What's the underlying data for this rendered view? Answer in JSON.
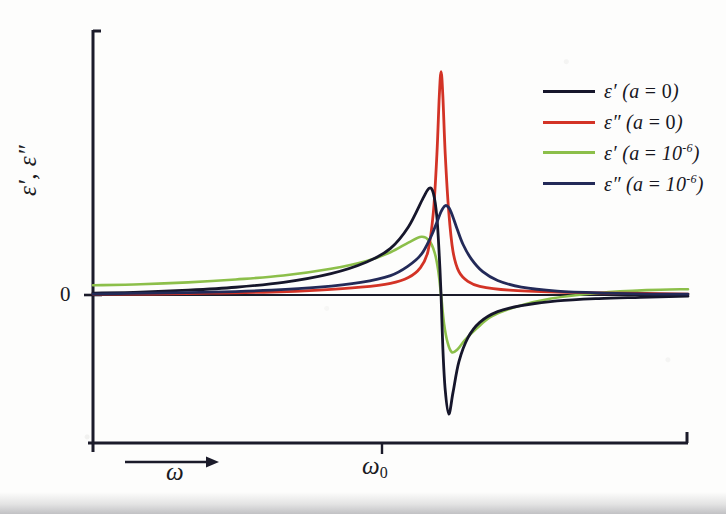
{
  "figure": {
    "background_color": "#fdfdfc",
    "axis_color": "#1b1b2a"
  },
  "labels": {
    "ylabel": "ε′, ε″",
    "zero_tick": "0",
    "omega_label": "ω",
    "omega0_label": "ω",
    "omega0_subscript": "0"
  },
  "legend": {
    "entries": [
      {
        "label_prefix": "ε′",
        "label_suffix": " (a = 0)",
        "color": "#16162b",
        "exponent": ""
      },
      {
        "label_prefix": "ε″",
        "label_suffix": " (a = 0)",
        "color": "#d33326",
        "exponent": ""
      },
      {
        "label_prefix": "ε′",
        "label_suffix": " (a = 10",
        "color": "#8cbf4a",
        "exponent": "-6"
      },
      {
        "label_prefix": "ε″",
        "label_suffix": " (a = 10",
        "color": "#232a58",
        "exponent": "-6"
      }
    ]
  },
  "chart_data": {
    "type": "line",
    "title": "",
    "xlabel": "ω",
    "ylabel": "ε′, ε″",
    "xlim": [
      0,
      1
    ],
    "ylim": [
      -1.05,
      2.4
    ],
    "grid": false,
    "legend_position": "upper-right",
    "xticks": [
      {
        "value": 0.585,
        "label": "ω0"
      }
    ],
    "yticks": [
      {
        "value": 0,
        "label": "0"
      }
    ],
    "annotations": [
      {
        "text": "ω",
        "type": "arrow-label",
        "position": "below-axis-left"
      }
    ],
    "resonance_x": 0.585,
    "series": [
      {
        "name": "ε′ (a = 0)",
        "color": "#16162b",
        "description": "Lorentz real part, undamped-limit: rises to a sharp positive maximum just below resonance, crosses zero at ω0, deep negative minimum just above resonance, then recovers toward zero.",
        "x": [
          0.0,
          0.08,
          0.16,
          0.24,
          0.32,
          0.4,
          0.46,
          0.5,
          0.53,
          0.555,
          0.565,
          0.572,
          0.578,
          0.582,
          0.585,
          0.588,
          0.592,
          0.598,
          0.605,
          0.615,
          0.63,
          0.65,
          0.68,
          0.72,
          0.78,
          0.85,
          0.92,
          1.0
        ],
        "y": [
          0.02,
          0.03,
          0.05,
          0.08,
          0.13,
          0.22,
          0.34,
          0.48,
          0.7,
          1.0,
          1.1,
          1.05,
          0.8,
          0.4,
          0.0,
          -0.45,
          -0.8,
          -1.0,
          -0.82,
          -0.56,
          -0.36,
          -0.23,
          -0.14,
          -0.09,
          -0.05,
          -0.03,
          -0.02,
          -0.01
        ]
      },
      {
        "name": "ε″ (a = 0)",
        "color": "#d33326",
        "description": "Lorentz imaginary part, undamped-limit: tall narrow symmetric peak centered at ω0 reaching the top of the plot.",
        "x": [
          0.0,
          0.1,
          0.2,
          0.3,
          0.38,
          0.45,
          0.5,
          0.53,
          0.55,
          0.563,
          0.572,
          0.578,
          0.582,
          0.585,
          0.588,
          0.592,
          0.598,
          0.605,
          0.615,
          0.63,
          0.65,
          0.7,
          0.78,
          0.88,
          1.0
        ],
        "y": [
          0.01,
          0.01,
          0.02,
          0.03,
          0.05,
          0.08,
          0.12,
          0.18,
          0.28,
          0.45,
          0.85,
          1.45,
          2.05,
          2.3,
          2.05,
          1.45,
          0.85,
          0.45,
          0.24,
          0.14,
          0.09,
          0.05,
          0.03,
          0.02,
          0.01
        ]
      },
      {
        "name": "ε′ (a = 10⁻⁶)",
        "color": "#8cbf4a",
        "description": "Real part with spatial-dispersion parameter a = 1e-6: elevated background at low ω, broad shoulder peak below resonance, shallow negative dip above resonance, returns to a small positive offset.",
        "x": [
          0.0,
          0.08,
          0.16,
          0.24,
          0.32,
          0.4,
          0.46,
          0.5,
          0.53,
          0.552,
          0.565,
          0.574,
          0.58,
          0.585,
          0.59,
          0.596,
          0.603,
          0.612,
          0.625,
          0.645,
          0.67,
          0.71,
          0.77,
          0.85,
          0.93,
          1.0
        ],
        "y": [
          0.1,
          0.11,
          0.13,
          0.16,
          0.2,
          0.27,
          0.35,
          0.44,
          0.54,
          0.6,
          0.56,
          0.44,
          0.26,
          0.0,
          -0.24,
          -0.4,
          -0.48,
          -0.46,
          -0.38,
          -0.28,
          -0.18,
          -0.1,
          -0.03,
          0.02,
          0.05,
          0.06
        ]
      },
      {
        "name": "ε″ (a = 10⁻⁶)",
        "color": "#232a58",
        "description": "Imaginary part with a = 1e-6: broadened peak slightly above resonance, lower and wider than the a=0 case, with longer tails.",
        "x": [
          0.0,
          0.1,
          0.2,
          0.3,
          0.38,
          0.45,
          0.5,
          0.53,
          0.552,
          0.568,
          0.578,
          0.585,
          0.592,
          0.598,
          0.604,
          0.612,
          0.622,
          0.636,
          0.655,
          0.68,
          0.72,
          0.78,
          0.86,
          0.94,
          1.0
        ],
        "y": [
          0.01,
          0.02,
          0.03,
          0.05,
          0.08,
          0.13,
          0.2,
          0.3,
          0.42,
          0.6,
          0.75,
          0.86,
          0.92,
          0.9,
          0.82,
          0.68,
          0.52,
          0.37,
          0.24,
          0.15,
          0.08,
          0.04,
          0.02,
          0.01,
          0.01
        ]
      }
    ]
  }
}
